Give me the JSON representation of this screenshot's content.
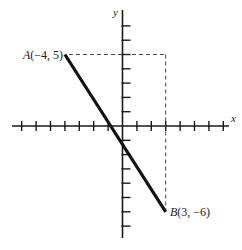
{
  "diagram": {
    "type": "coordinate-plane",
    "axes": {
      "x_label": "x",
      "y_label": "y",
      "x_ticks": [
        -7,
        -6,
        -5,
        -4,
        -3,
        -2,
        -1,
        1,
        2,
        3,
        4,
        5,
        6,
        7
      ],
      "y_ticks": [
        -7,
        -6,
        -5,
        -4,
        -3,
        -2,
        -1,
        1,
        2,
        3,
        4,
        5,
        6,
        7
      ]
    },
    "points": [
      {
        "id": "A",
        "name": "A",
        "coords_text": "(−4, 5)",
        "x": -4,
        "y": 5
      },
      {
        "id": "B",
        "name": "B",
        "coords_text": "(3, −6)",
        "x": 3,
        "y": -6
      }
    ],
    "segment": {
      "from": "A",
      "to": "B"
    },
    "guides": [
      {
        "kind": "horizontal-dashed",
        "from": [
          -4,
          5
        ],
        "to": [
          3,
          5
        ]
      },
      {
        "kind": "vertical-dashed",
        "from": [
          3,
          5
        ],
        "to": [
          3,
          -6
        ]
      }
    ],
    "colors": {
      "ink": "#111111",
      "background": "#ffffff"
    }
  }
}
